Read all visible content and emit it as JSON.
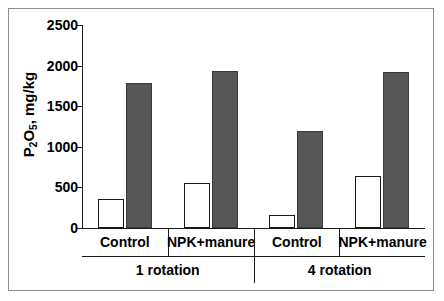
{
  "chart_data": {
    "type": "bar",
    "title": "",
    "xlabel": "",
    "ylabel_html": "P<sub>2</sub>O<sub>5</sub>, mg/kg",
    "ylabel_text": "P2O5, mg/kg",
    "ylim": [
      0,
      2500
    ],
    "ytick_values": [
      0,
      500,
      1000,
      1500,
      2000,
      2500
    ],
    "ytick_labels": [
      "0",
      "500",
      "1000",
      "1500",
      "2000",
      "2500"
    ],
    "grid": false,
    "legend": null,
    "categories": [
      "Control",
      "NPK+manure",
      "Control",
      "NPK+manure"
    ],
    "group_labels": [
      "1 rotation",
      "4 rotation"
    ],
    "series": [
      {
        "name": "open-bar",
        "fill": "#ffffff",
        "values": [
          360,
          555,
          160,
          645
        ]
      },
      {
        "name": "filled-bar",
        "fill": "#565656",
        "values": [
          1780,
          1930,
          1190,
          1920
        ]
      }
    ],
    "groups": [
      {
        "rotation": "1 rotation",
        "treatments": [
          {
            "label": "Control",
            "open": 360,
            "filled": 1780
          },
          {
            "label": "NPK+manure",
            "open": 555,
            "filled": 1930
          }
        ]
      },
      {
        "rotation": "4 rotation",
        "treatments": [
          {
            "label": "Control",
            "open": 160,
            "filled": 1190
          },
          {
            "label": "NPK+manure",
            "open": 645,
            "filled": 1920
          }
        ]
      }
    ]
  },
  "axis": {
    "y_title_prefix": "P",
    "y_title_sub1": "2",
    "y_title_mid": "O",
    "y_title_sub2": "5",
    "y_title_suffix": ", mg/kg"
  },
  "labels": {
    "treatments": [
      "Control",
      "NPK+manure",
      "Control",
      "NPK+manure"
    ],
    "rotations": [
      "1 rotation",
      "4 rotation"
    ]
  },
  "colors": {
    "open_bar": "#ffffff",
    "filled_bar": "#565656",
    "axis": "#1a1a1a",
    "frame": "#8d8d8d",
    "background": "#ffffff"
  }
}
